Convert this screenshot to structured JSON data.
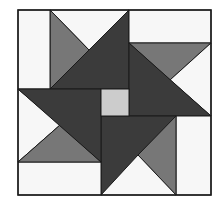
{
  "figure": {
    "colors": {
      "background": "#ffffff",
      "white": "#f7f7f7",
      "medium": "#777777",
      "dark": "#3b3b3b",
      "center": "#cccccc",
      "stroke": "#1a1a1a"
    }
  }
}
